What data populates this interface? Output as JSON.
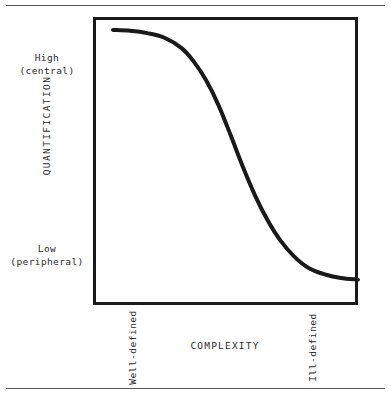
{
  "chart_data": {
    "type": "line",
    "title": "",
    "xlabel": "COMPLEXITY",
    "ylabel": "QUANTIFICATION",
    "x_tick_labels": [
      "Well-defined",
      "Ill-defined"
    ],
    "y_tick_labels": [
      "High\n(central)",
      "Low\n(peripheral)"
    ],
    "y_tick_labels_split": [
      {
        "line1": "High",
        "line2": "(central)"
      },
      {
        "line1": "Low",
        "line2": "(peripheral)"
      }
    ],
    "xlim": [
      0,
      1
    ],
    "ylim": [
      0,
      1
    ],
    "grid": false,
    "legend": null,
    "line_color": "#1a1a1a",
    "series": [
      {
        "name": "quantification vs complexity",
        "shape": "decreasing-sigmoid",
        "x": [
          0.0,
          0.07,
          0.14,
          0.21,
          0.28,
          0.33,
          0.38,
          0.43,
          0.48,
          0.53,
          0.58,
          0.63,
          0.68,
          0.74,
          0.8,
          0.87,
          0.93,
          1.0
        ],
        "y": [
          0.955,
          0.952,
          0.944,
          0.928,
          0.892,
          0.845,
          0.78,
          0.695,
          0.59,
          0.48,
          0.38,
          0.296,
          0.228,
          0.168,
          0.128,
          0.105,
          0.094,
          0.088
        ]
      }
    ]
  },
  "axes": {
    "y_high": {
      "line1": "High",
      "line2": "(central)"
    },
    "y_low": {
      "line1": "Low",
      "line2": "(peripheral)"
    },
    "y_title": "QUANTIFICATION",
    "x_title": "COMPLEXITY",
    "x_left": "Well-defined",
    "x_right": "Ill-defined"
  },
  "colors": {
    "ink": "#1a1a1a",
    "text": "#2b2b2b",
    "rule": "#555a5c",
    "background": "#ffffff"
  }
}
